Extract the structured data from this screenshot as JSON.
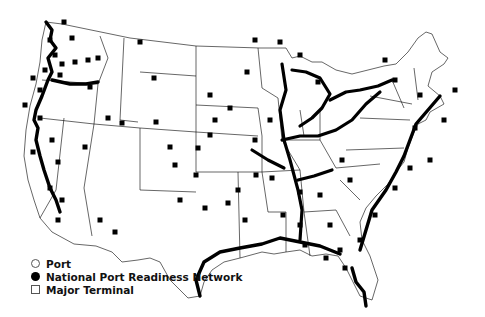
{
  "map": {
    "region": "Contiguous United States",
    "style": "black and white outline with state borders",
    "marker_color": "#000000",
    "background_color": "#ffffff"
  },
  "legend": {
    "items": [
      {
        "symbol": "open-circle",
        "label": "Port"
      },
      {
        "symbol": "filled-circle",
        "label": "National Port Readiness Network"
      },
      {
        "symbol": "open-square",
        "label": "Major Terminal"
      }
    ]
  },
  "markers": {
    "dense_corridors": [
      "Pacific Northwest / Columbia River",
      "California coast",
      "Gulf Coast",
      "Mississippi River",
      "Ohio River",
      "Great Lakes",
      "Atlantic Coast"
    ],
    "terminals": [
      [
        64,
        22
      ],
      [
        72,
        38
      ],
      [
        50,
        40
      ],
      [
        55,
        55
      ],
      [
        62,
        64
      ],
      [
        75,
        62
      ],
      [
        88,
        60
      ],
      [
        98,
        58
      ],
      [
        45,
        70
      ],
      [
        33,
        78
      ],
      [
        60,
        75
      ],
      [
        40,
        90
      ],
      [
        25,
        105
      ],
      [
        140,
        42
      ],
      [
        154,
        78
      ],
      [
        90,
        87
      ],
      [
        40,
        118
      ],
      [
        52,
        140
      ],
      [
        33,
        152
      ],
      [
        58,
        162
      ],
      [
        85,
        147
      ],
      [
        50,
        188
      ],
      [
        62,
        200
      ],
      [
        58,
        220
      ],
      [
        100,
        220
      ],
      [
        115,
        232
      ],
      [
        175,
        165
      ],
      [
        170,
        147
      ],
      [
        198,
        148
      ],
      [
        210,
        135
      ],
      [
        122,
        123
      ],
      [
        108,
        118
      ],
      [
        156,
        122
      ],
      [
        196,
        175
      ],
      [
        180,
        200
      ],
      [
        205,
        208
      ],
      [
        228,
        203
      ],
      [
        238,
        190
      ],
      [
        256,
        175
      ],
      [
        272,
        178
      ],
      [
        245,
        220
      ],
      [
        283,
        215
      ],
      [
        300,
        225
      ],
      [
        305,
        245
      ],
      [
        326,
        258
      ],
      [
        340,
        250
      ],
      [
        345,
        268
      ],
      [
        360,
        240
      ],
      [
        375,
        215
      ],
      [
        395,
        188
      ],
      [
        410,
        168
      ],
      [
        430,
        160
      ],
      [
        415,
        128
      ],
      [
        444,
        120
      ],
      [
        455,
        90
      ],
      [
        420,
        95
      ],
      [
        395,
        80
      ],
      [
        385,
        60
      ],
      [
        342,
        160
      ],
      [
        350,
        180
      ],
      [
        320,
        195
      ],
      [
        300,
        192
      ],
      [
        330,
        225
      ],
      [
        270,
        120
      ],
      [
        255,
        140
      ],
      [
        230,
        108
      ],
      [
        215,
        120
      ],
      [
        210,
        95
      ],
      [
        247,
        72
      ],
      [
        255,
        40
      ],
      [
        280,
        42
      ],
      [
        300,
        55
      ],
      [
        318,
        82
      ]
    ]
  }
}
